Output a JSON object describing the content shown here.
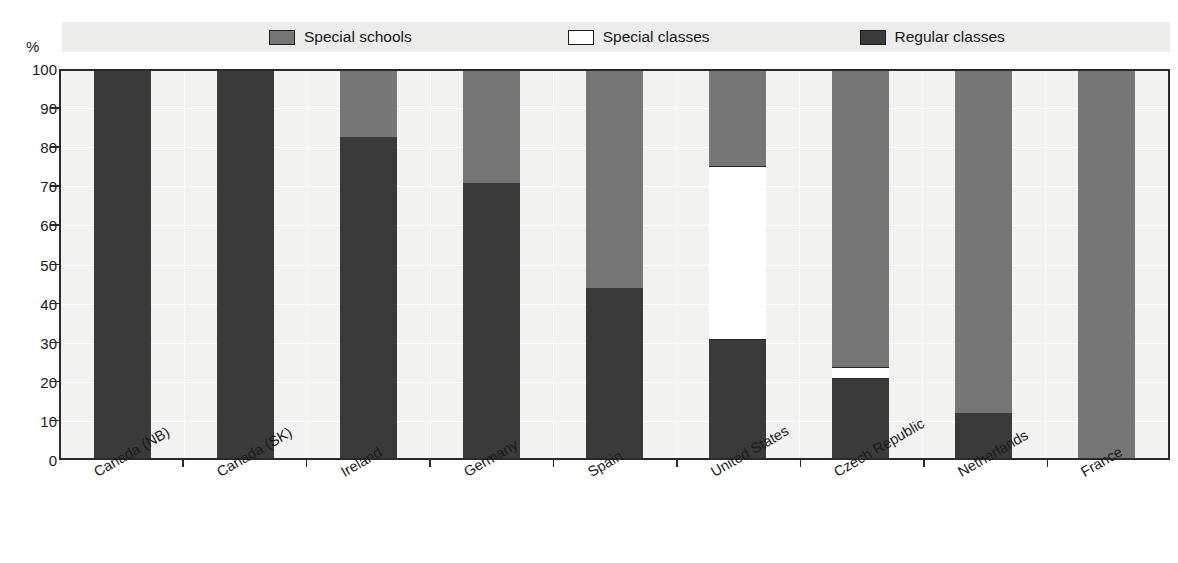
{
  "axis": {
    "y_unit": "%",
    "y_ticks": [
      0,
      10,
      20,
      30,
      40,
      50,
      60,
      70,
      80,
      90,
      100
    ]
  },
  "legend": {
    "items": [
      {
        "label": "Special schools",
        "color": "#767676",
        "key": "special_schools"
      },
      {
        "label": "Special classes",
        "color": "#ffffff",
        "key": "special_classes"
      },
      {
        "label": "Regular classes",
        "color": "#3a3a3a",
        "key": "regular_classes"
      }
    ]
  },
  "chart_data": {
    "type": "bar",
    "title": "",
    "xlabel": "",
    "ylabel": "%",
    "ylim": [
      0,
      100
    ],
    "grid": true,
    "stacked": true,
    "legend_position": "top",
    "categories": [
      "Canada (NB)",
      "Canada (SK)",
      "Ireland",
      "Germany",
      "Spain",
      "United States",
      "Czech Republic",
      "Netherlands",
      "France"
    ],
    "series": [
      {
        "name": "Regular classes",
        "color": "#3a3a3a",
        "values": [
          100,
          100,
          83,
          71,
          44,
          30.5,
          20.3,
          11.7,
          0
        ]
      },
      {
        "name": "Special classes",
        "color": "#ffffff",
        "values": [
          0,
          0,
          0,
          0,
          0,
          45,
          3.2,
          0,
          0
        ]
      },
      {
        "name": "Special schools",
        "color": "#767676",
        "values": [
          0,
          0,
          17,
          29,
          56,
          24.5,
          76.5,
          88.3,
          100
        ]
      }
    ]
  }
}
